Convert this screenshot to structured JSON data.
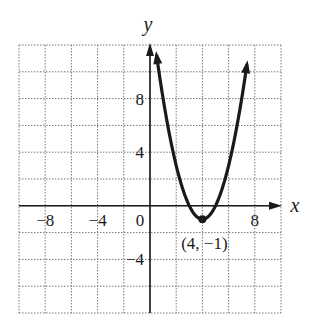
{
  "chart_data": {
    "type": "line",
    "title": "",
    "xlabel": "x",
    "ylabel": "y",
    "xlim": [
      -10,
      10
    ],
    "ylim": [
      -8,
      12
    ],
    "grid": true,
    "grid_step": 2,
    "x_ticks": [
      {
        "value": -8,
        "label": "−8"
      },
      {
        "value": -4,
        "label": "−4"
      },
      {
        "value": 0,
        "label": "0"
      },
      {
        "value": 8,
        "label": "8"
      }
    ],
    "y_ticks": [
      {
        "value": 8,
        "label": "8"
      },
      {
        "value": 4,
        "label": "4"
      },
      {
        "value": -4,
        "label": "−4"
      }
    ],
    "series": [
      {
        "name": "parabola",
        "equation": "y = (x - 4)^2 - 1",
        "vertex": [
          4,
          -1
        ],
        "x_range": [
          0.5,
          7.4
        ]
      }
    ],
    "annotations": [
      {
        "text": "(4, −1)",
        "x": 4,
        "y": -1
      }
    ]
  }
}
